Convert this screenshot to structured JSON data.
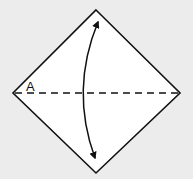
{
  "diagram": {
    "type": "origami-fold-step",
    "background": "#ececec",
    "paper_color": "#ffffff",
    "line_color": "#111111",
    "square": {
      "shape": "diamond",
      "vertices": {
        "top": [
          96,
          10
        ],
        "right": [
          180,
          93
        ],
        "bottom": [
          96,
          173
        ],
        "left": [
          13,
          93
        ]
      }
    },
    "fold_line": {
      "style": "valley-fold-dashed",
      "from": [
        13,
        93
      ],
      "to": [
        180,
        93
      ]
    },
    "arrow": {
      "style": "curved-double-headed",
      "meaning": "fold-and-unfold",
      "start": [
        98,
        22
      ],
      "end": [
        95,
        158
      ],
      "bulge_x": 83
    },
    "labels": [
      {
        "text": "A",
        "x": 26,
        "y": 91
      }
    ]
  }
}
